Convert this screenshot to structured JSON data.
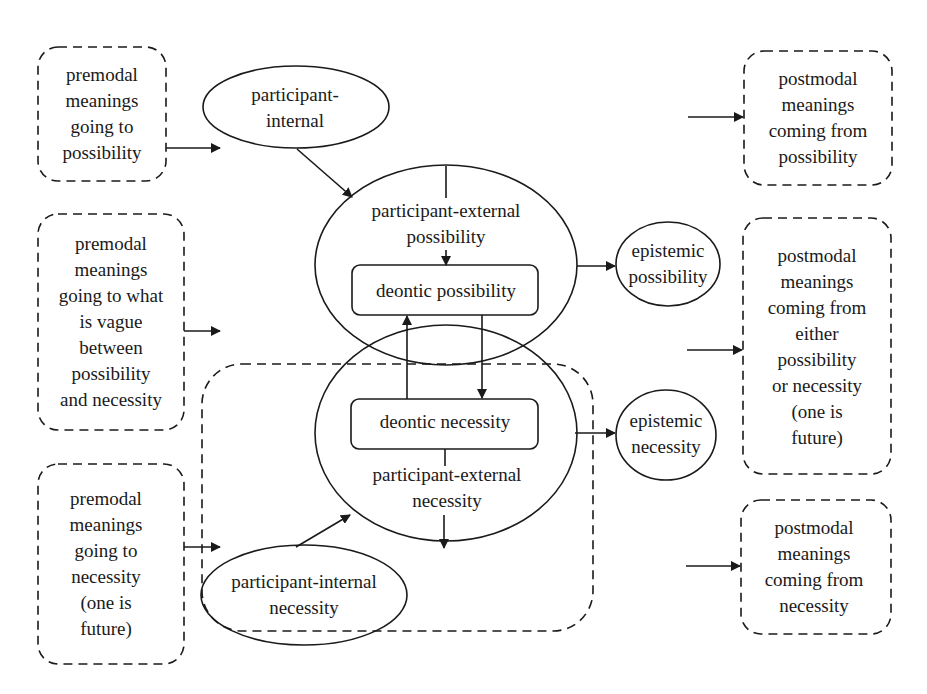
{
  "diagram": {
    "premodal": [
      {
        "id": "pre-possibility",
        "label": "premodal\nmeanings\ngoing to\npossibility"
      },
      {
        "id": "pre-vague",
        "label": "premodal\nmeanings\ngoing to what\nis vague\nbetween\npossibility\nand necessity"
      },
      {
        "id": "pre-necessity",
        "label": "premodal\nmeanings\ngoing to\nnecessity\n(one is\nfuture)"
      }
    ],
    "postmodal": [
      {
        "id": "post-possibility",
        "label": "postmodal\nmeanings\ncoming from\npossibility"
      },
      {
        "id": "post-either",
        "label": "postmodal\nmeanings\ncoming from\neither\npossibility\nor necessity\n(one is\nfuture)"
      },
      {
        "id": "post-necessity",
        "label": "postmodal\nmeanings\ncoming from\nnecessity"
      }
    ],
    "nodes": {
      "participant_internal": "participant-\ninternal",
      "participant_external_possibility": "participant-external\npossibility",
      "deontic_possibility": "deontic possibility",
      "deontic_necessity": "deontic necessity",
      "participant_external_necessity": "participant-external\nnecessity",
      "participant_internal_necessity": "participant-internal\nnecessity",
      "epistemic_possibility": "epistemic\npossibility",
      "epistemic_necessity": "epistemic\nnecessity"
    },
    "colors": {
      "stroke": "#1a1a1a",
      "background": "#ffffff"
    }
  }
}
